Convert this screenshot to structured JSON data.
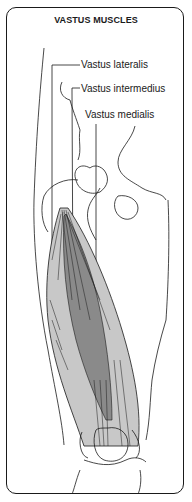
{
  "title": "VASTUS MUSCLES",
  "labels": {
    "lateralis": "Vastus lateralis",
    "intermedius": "Vastus intermedius",
    "medialis": "Vastus medialis"
  },
  "colors": {
    "line": "#1a1a1a",
    "muscle_light": "#c8c8c8",
    "muscle_dark": "#8a8a8a"
  }
}
